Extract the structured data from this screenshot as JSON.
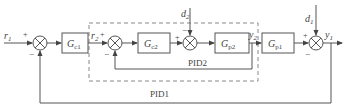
{
  "diagram": {
    "type": "cascade PID control block diagram",
    "signals": {
      "r1": {
        "base": "r",
        "sub": "1"
      },
      "r2": {
        "base": "r",
        "sub": "2"
      },
      "d1": {
        "base": "d",
        "sub": "1"
      },
      "d2": {
        "base": "d",
        "sub": "2"
      },
      "y1": {
        "base": "y",
        "sub": "1"
      },
      "y2": {
        "base": "y",
        "sub": "2"
      }
    },
    "blocks": [
      {
        "id": "gc1",
        "base": "G",
        "sub": "c1"
      },
      {
        "id": "gc2",
        "base": "G",
        "sub": "c2"
      },
      {
        "id": "gp2",
        "base": "G",
        "sub": "p2"
      },
      {
        "id": "gp1",
        "base": "G",
        "sub": "p1"
      }
    ],
    "signs": {
      "plus": "+",
      "minus": "−"
    },
    "loops": {
      "inner": "PID2",
      "outer": "PID1"
    },
    "colors": {
      "line": "#555555",
      "dashed": "#888888",
      "text": "#444444"
    }
  }
}
